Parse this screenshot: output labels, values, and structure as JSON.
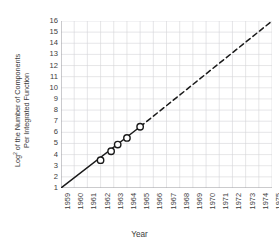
{
  "chart_data": {
    "type": "line",
    "title": "",
    "xlabel": "Year",
    "ylabel_line1": "Log",
    "ylabel_sup": "2",
    "ylabel_line1_rest": " of the Number of Components",
    "ylabel_line2": "Per Integrated Function",
    "ylabel_full": "Log2 of the Number of Components Per Integrated Function",
    "xlim": [
      1959,
      1975
    ],
    "ylim": [
      1,
      16
    ],
    "grid": true,
    "legend": "none",
    "x_ticks": [
      "1959",
      "1960",
      "1961",
      "1962",
      "1963",
      "1964",
      "1965",
      "1966",
      "1967",
      "1968",
      "1969",
      "1970",
      "1971",
      "1972",
      "1973",
      "1974",
      "1975"
    ],
    "y_ticks": [
      "1",
      "2",
      "3",
      "4",
      "5",
      "6",
      "7",
      "8",
      "9",
      "10",
      "11",
      "12",
      "13",
      "14",
      "15",
      "16"
    ],
    "series": [
      {
        "name": "Observed trend",
        "style": "solid",
        "x": [
          1959,
          1965
        ],
        "y": [
          1,
          6.5
        ]
      },
      {
        "name": "Extrapolated trend",
        "style": "dashed",
        "x": [
          1965,
          1975
        ],
        "y": [
          6.5,
          16
        ]
      }
    ],
    "markers": {
      "name": "Measured data points",
      "shape": "open-circle",
      "x": [
        1962,
        1962.8,
        1963.3,
        1964,
        1965
      ],
      "y": [
        3.5,
        4.3,
        4.9,
        5.5,
        6.5
      ]
    },
    "colors": {
      "line": "#1a1a1a",
      "marker_stroke": "#1a1a1a",
      "marker_fill": "#ffffff",
      "grid": "#d5d5d8",
      "axis": "#9a9a9e",
      "text": "#3c3c3c",
      "background": "#ffffff"
    }
  }
}
